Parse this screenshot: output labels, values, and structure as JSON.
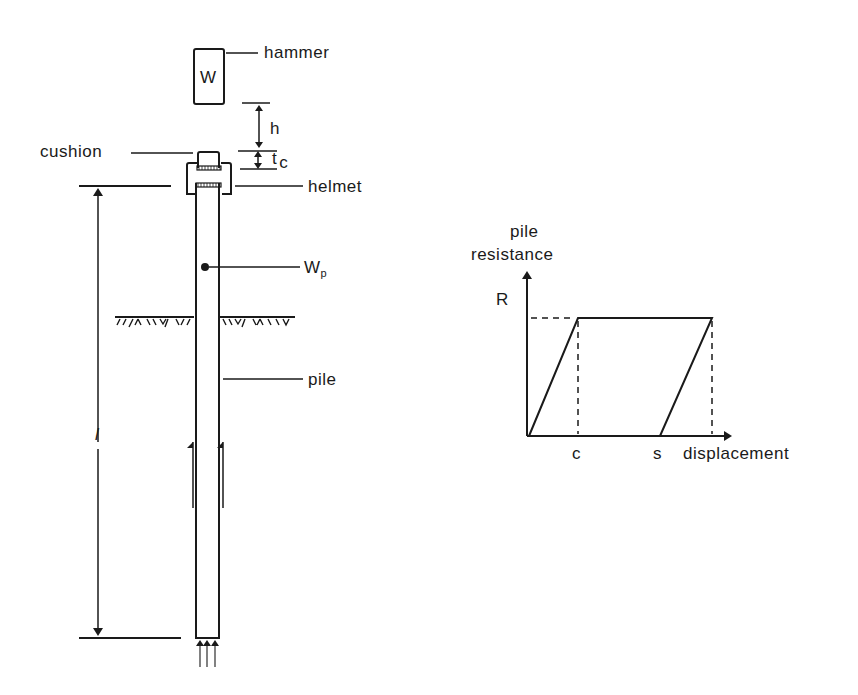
{
  "figure": {
    "left_diagram": {
      "hammer": {
        "symbol": "W",
        "label": "hammer"
      },
      "drop_height": {
        "label": "h"
      },
      "cushion_thickness": {
        "label": "t",
        "subscript": "c"
      },
      "cushion": {
        "label": "cushion"
      },
      "helmet": {
        "label": "helmet"
      },
      "pile_weight": {
        "label": "W",
        "subscript": "p"
      },
      "pile": {
        "label": "pile"
      },
      "pile_length": {
        "label": "l"
      }
    },
    "right_diagram": {
      "y_axis_label_line1": "pile",
      "y_axis_label_line2": "resistance",
      "y_marker": "R",
      "x_marker_c": "c",
      "x_marker_s": "s",
      "x_axis_label": "displacement"
    }
  },
  "chart_data": {
    "type": "line",
    "title": "",
    "xlabel": "displacement",
    "ylabel": "pile resistance",
    "x_ticks": [
      "c",
      "s"
    ],
    "y_ticks": [
      "R"
    ],
    "series": [
      {
        "name": "load-displacement",
        "points": [
          {
            "x": 0,
            "y": 0
          },
          {
            "x": "c",
            "y": "R"
          },
          {
            "x": "s + c",
            "y": "R"
          },
          {
            "x": "s",
            "y": 0
          }
        ]
      }
    ],
    "reference_lines": [
      {
        "type": "horizontal",
        "at": "R",
        "style": "dashed"
      },
      {
        "type": "vertical",
        "at": "c",
        "style": "dashed"
      },
      {
        "type": "vertical",
        "at": "s + c",
        "style": "dashed"
      }
    ],
    "grid": false
  }
}
